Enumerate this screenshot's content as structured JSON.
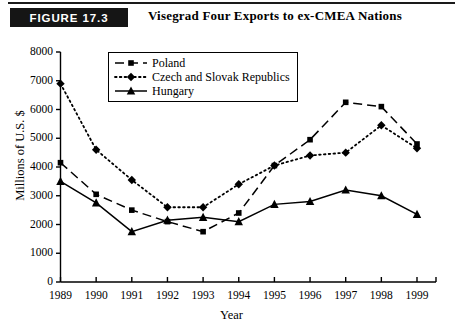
{
  "header": {
    "badge": "FIGURE 17.3",
    "title": "Visegrad Four Exports to ex-CMEA Nations"
  },
  "chart_data": {
    "type": "line",
    "title": "Visegrad Four Exports to ex-CMEA Nations",
    "xlabel": "Year",
    "ylabel": "Millions of U.S. $",
    "xlim": [
      1989,
      1999
    ],
    "ylim": [
      0,
      8000
    ],
    "yticks": [
      0,
      1000,
      2000,
      3000,
      4000,
      5000,
      6000,
      7000,
      8000
    ],
    "ytick_labels": [
      "0",
      "1000",
      "2000",
      "3000",
      "4000",
      "5000",
      "6000",
      "7000",
      "8000"
    ],
    "grid": false,
    "legend_position": "upper center",
    "categories": [
      1989,
      1990,
      1991,
      1992,
      1993,
      1994,
      1995,
      1996,
      1997,
      1998,
      1999
    ],
    "xtick_labels": [
      "1989",
      "1990",
      "1991",
      "1992",
      "1993",
      "1994",
      "1995",
      "1996",
      "1997",
      "1998",
      "1999"
    ],
    "series": [
      {
        "name": "Poland",
        "marker": "square",
        "linestyle": "dashed",
        "color": "#000000",
        "values": [
          4150,
          3050,
          2500,
          2100,
          1750,
          2400,
          4050,
          4950,
          6250,
          6100,
          4800
        ]
      },
      {
        "name": "Czech and Slovak Republics",
        "marker": "diamond",
        "linestyle": "dotted",
        "color": "#000000",
        "values": [
          6900,
          4600,
          3550,
          2600,
          2600,
          3400,
          4050,
          4400,
          4500,
          5450,
          4650
        ]
      },
      {
        "name": "Hungary",
        "marker": "triangle",
        "linestyle": "solid",
        "color": "#000000",
        "values": [
          3500,
          2750,
          1750,
          2150,
          2250,
          2100,
          2700,
          2800,
          3200,
          3000,
          2350
        ]
      }
    ]
  }
}
